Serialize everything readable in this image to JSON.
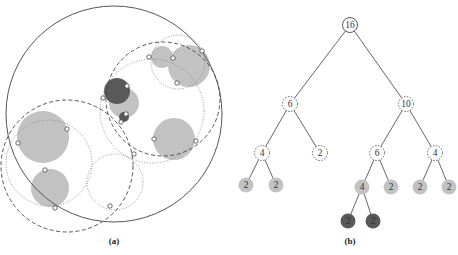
{
  "panel_a": {
    "caption": "(a)",
    "outer_circle": {
      "cx": 114,
      "cy": 114,
      "r": 108
    },
    "colors": {
      "light_fill": "#c2c2c2",
      "dark_fill": "#595959",
      "stroke": "#555555",
      "dashed": "#444444",
      "dotted": "#888888"
    },
    "filled_circles": [
      {
        "cx": 162,
        "cy": 57,
        "r": 11,
        "tone": "light"
      },
      {
        "cx": 189,
        "cy": 66,
        "r": 21,
        "tone": "light"
      },
      {
        "cx": 124,
        "cy": 103,
        "r": 15,
        "tone": "light"
      },
      {
        "cx": 117,
        "cy": 91,
        "r": 13,
        "tone": "dark"
      },
      {
        "cx": 124,
        "cy": 117,
        "r": 5,
        "tone": "dark"
      },
      {
        "cx": 174,
        "cy": 139,
        "r": 21,
        "tone": "light"
      },
      {
        "cx": 43,
        "cy": 137,
        "r": 26,
        "tone": "light"
      },
      {
        "cx": 50,
        "cy": 188,
        "r": 19,
        "tone": "light"
      }
    ],
    "dashed_circles": [
      {
        "cx": 163,
        "cy": 99,
        "r": 57
      },
      {
        "cx": 67,
        "cy": 166,
        "r": 66
      }
    ],
    "dotted_circles": [
      {
        "cx": 178,
        "cy": 62,
        "r": 27
      },
      {
        "cx": 152,
        "cy": 111,
        "r": 52
      },
      {
        "cx": 49,
        "cy": 163,
        "r": 43
      },
      {
        "cx": 115,
        "cy": 182,
        "r": 28
      }
    ],
    "points": [
      [
        149,
        57
      ],
      [
        173,
        58
      ],
      [
        202,
        51
      ],
      [
        177,
        83
      ],
      [
        127,
        86
      ],
      [
        103,
        98
      ],
      [
        126,
        114
      ],
      [
        121,
        122
      ],
      [
        154,
        139
      ],
      [
        196,
        141
      ],
      [
        67,
        129
      ],
      [
        18,
        143
      ],
      [
        134,
        154
      ],
      [
        45,
        170
      ],
      [
        55,
        208
      ],
      [
        110,
        206
      ]
    ]
  },
  "panel_b": {
    "caption": "(b)",
    "colors": {
      "light_fill": "#c2c2c2",
      "dark_fill": "#595959",
      "edge": "#555555"
    },
    "nodes": [
      {
        "id": "n16",
        "label": "16",
        "x": 350,
        "y": 25,
        "style": "solid"
      },
      {
        "id": "n6a",
        "label": "6",
        "x": 290,
        "y": 104,
        "style": "dashed"
      },
      {
        "id": "n10",
        "label": "10",
        "x": 406,
        "y": 104,
        "style": "dashed"
      },
      {
        "id": "n4a",
        "label": "4",
        "x": 262,
        "y": 153,
        "style": "dashed"
      },
      {
        "id": "n2a",
        "label": "2",
        "x": 320,
        "y": 153,
        "style": "dashed"
      },
      {
        "id": "n6b",
        "label": "6",
        "x": 377,
        "y": 153,
        "style": "dashed"
      },
      {
        "id": "n4b",
        "label": "4",
        "x": 435,
        "y": 153,
        "style": "dashed"
      },
      {
        "id": "l1",
        "label": "2",
        "x": 246,
        "y": 185,
        "style": "light"
      },
      {
        "id": "l2",
        "label": "2",
        "x": 276,
        "y": 185,
        "style": "light"
      },
      {
        "id": "n4c",
        "label": "4",
        "x": 362,
        "y": 187,
        "style": "light"
      },
      {
        "id": "l3",
        "label": "2",
        "x": 391,
        "y": 187,
        "style": "light"
      },
      {
        "id": "l4",
        "label": "2",
        "x": 420,
        "y": 187,
        "style": "light"
      },
      {
        "id": "l5",
        "label": "2",
        "x": 449,
        "y": 187,
        "style": "light"
      },
      {
        "id": "d1",
        "label": "2",
        "x": 348,
        "y": 221,
        "style": "dark"
      },
      {
        "id": "d2",
        "label": "2",
        "x": 373,
        "y": 221,
        "style": "dark"
      }
    ],
    "edges": [
      [
        "n16",
        "n6a"
      ],
      [
        "n16",
        "n10"
      ],
      [
        "n6a",
        "n4a"
      ],
      [
        "n6a",
        "n2a"
      ],
      [
        "n10",
        "n6b"
      ],
      [
        "n10",
        "n4b"
      ],
      [
        "n4a",
        "l1"
      ],
      [
        "n4a",
        "l2"
      ],
      [
        "n6b",
        "n4c"
      ],
      [
        "n6b",
        "l3"
      ],
      [
        "n4b",
        "l4"
      ],
      [
        "n4b",
        "l5"
      ],
      [
        "n4c",
        "d1"
      ],
      [
        "n4c",
        "d2"
      ]
    ]
  }
}
